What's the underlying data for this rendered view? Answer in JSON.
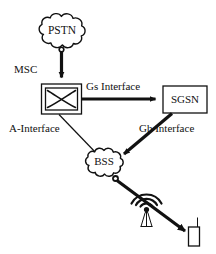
{
  "diagram": {
    "background_color": "#ffffff",
    "line_color": "#111111",
    "nodes": {
      "pstn": {
        "label": "PSTN",
        "shape": "cloud",
        "name": "pstn-cloud"
      },
      "msc": {
        "label": "MSC",
        "shape": "switch-box",
        "name": "msc-node"
      },
      "sgsn": {
        "label": "SGSN",
        "shape": "box",
        "name": "sgsn-node"
      },
      "bss": {
        "label": "BSS",
        "shape": "cloud",
        "name": "bss-cloud"
      },
      "antenna": {
        "label": "",
        "shape": "antenna-tower",
        "name": "antenna-tower"
      },
      "mobile": {
        "label": "",
        "shape": "mobile-phone",
        "name": "mobile-station"
      }
    },
    "edges": {
      "pstn_msc": {
        "label": "",
        "from": "pstn",
        "to": "msc",
        "style": "thick-arrow"
      },
      "gs": {
        "label": "Gs Interface",
        "from": "msc",
        "to": "sgsn",
        "style": "thick-arrow"
      },
      "a_interface": {
        "label": "A-Interface",
        "from": "msc",
        "to": "bss",
        "style": "thin-line"
      },
      "gb": {
        "label": "Gb Interface",
        "from": "sgsn",
        "to": "bss",
        "style": "thick-arrow"
      },
      "bss_mobile": {
        "label": "",
        "from": "bss",
        "to": "mobile",
        "style": "thick-arrow"
      }
    }
  }
}
